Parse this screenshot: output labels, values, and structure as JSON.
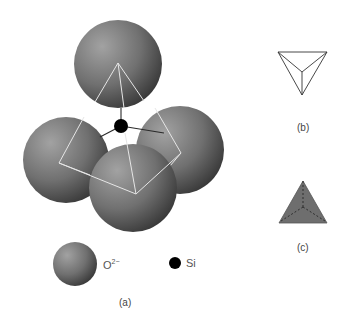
{
  "figure": {
    "panel_a": {
      "label": "(a)",
      "description": "SiO4 tetrahedron: four O2- spheres around central Si atom",
      "legend": {
        "oxygen_label": "O",
        "oxygen_charge": "2−",
        "silicon_label": "Si"
      }
    },
    "panel_b": {
      "label": "(b)",
      "description": "Wireframe tetrahedron"
    },
    "panel_c": {
      "label": "(c)",
      "description": "Solid shaded tetrahedron with dashed hidden edges"
    }
  },
  "colors": {
    "sphere_light": "#9a9a9a",
    "sphere_dark": "#3c3c3c",
    "silicon": "#000000",
    "edges_white": "#e8e8e8",
    "bond_lines": "#333333",
    "solid_tetra": "#6e6e6e"
  }
}
